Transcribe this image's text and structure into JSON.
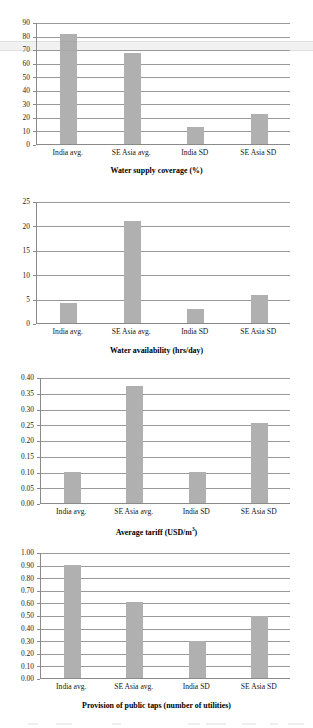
{
  "figure": {
    "background": "#ffffff",
    "bar_color": "#b0b0b0",
    "axis_color": "#8a8a8a",
    "grid_color": "#9a9a9a"
  },
  "chart_data": [
    {
      "type": "bar",
      "title": "",
      "xlabel": "Water supply coverage (%)",
      "ylabel": "",
      "categories": [
        "India avg.",
        "SE Asia avg.",
        "India SD",
        "SE Asia SD"
      ],
      "values": [
        81,
        67.5,
        12.5,
        22.5
      ],
      "ylim": [
        0,
        90
      ],
      "ytick_step": 10,
      "yticks": [
        "0",
        "10",
        "20",
        "30",
        "40",
        "50",
        "60",
        "70",
        "80",
        "90"
      ],
      "grid": true,
      "legend": "none"
    },
    {
      "type": "bar",
      "title": "",
      "xlabel": "Water availability (hrs/day)",
      "ylabel": "",
      "categories": [
        "India avg.",
        "SE Asia avg.",
        "India SD",
        "SE Asia SD"
      ],
      "values": [
        4.0,
        20.9,
        2.9,
        5.8
      ],
      "ylim": [
        0,
        25
      ],
      "ytick_step": 5,
      "yticks": [
        "0",
        "5",
        "10",
        "15",
        "20",
        "25"
      ],
      "grid": true,
      "legend": "none"
    },
    {
      "type": "bar",
      "title": "",
      "xlabel": "Average tariff (USD/m3)",
      "xlabel_prefix": "Average tariff (USD/m",
      "xlabel_sup": "3",
      "xlabel_suffix": ")",
      "ylabel": "",
      "categories": [
        "India avg.",
        "SE Asia avg.",
        "India SD",
        "SE Asia SD"
      ],
      "values": [
        0.1,
        0.37,
        0.098,
        0.255
      ],
      "ylim": [
        0,
        0.4
      ],
      "ytick_step": 0.05,
      "yticks": [
        "0.00",
        "0.05",
        "0.10",
        "0.15",
        "0.20",
        "0.25",
        "0.30",
        "0.35",
        "0.40"
      ],
      "grid": true,
      "legend": "none"
    },
    {
      "type": "bar",
      "title": "",
      "xlabel": "Provision of public taps (number of utilities)",
      "ylabel": "",
      "categories": [
        "India avg.",
        "SE Asia avg.",
        "India SD",
        "SE Asia SD"
      ],
      "values": [
        0.9,
        0.605,
        0.295,
        0.49
      ],
      "ylim": [
        0,
        1.0
      ],
      "ytick_step": 0.1,
      "yticks": [
        "0.00",
        "0.10",
        "0.20",
        "0.30",
        "0.40",
        "0.50",
        "0.60",
        "0.70",
        "0.80",
        "0.90",
        "1.00"
      ],
      "grid": true,
      "legend": "none"
    }
  ]
}
